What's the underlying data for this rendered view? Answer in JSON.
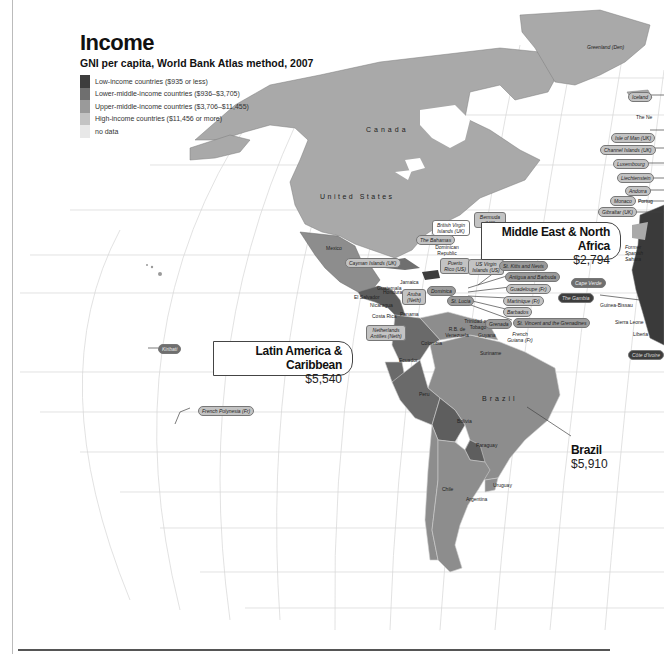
{
  "header": {
    "title": "Income",
    "subtitle": "GNI per capita, World Bank Atlas method, 2007"
  },
  "legend": [
    {
      "label": "Low-income countries ($935 or less)",
      "color": "#3d3d3d"
    },
    {
      "label": "Lower-middle-income countries ($936–$3,705)",
      "color": "#6f6f6f"
    },
    {
      "label": "Upper-middle-income countries ($3,706–$11,455)",
      "color": "#9a9a9a"
    },
    {
      "label": "High-income countries ($11,456 or more)",
      "color": "#c3c3c3"
    },
    {
      "label": "no data",
      "color": "#e8e8e8"
    }
  ],
  "callouts": {
    "mena": {
      "name": "Middle East & North Africa",
      "value": "$2,794"
    },
    "latam": {
      "name": "Latin America & Caribbean",
      "value": "$5,540"
    },
    "brazil": {
      "name": "Brazil",
      "value": "$5,910"
    }
  },
  "country_labels": {
    "canada": "Canada",
    "us": "United States",
    "brazil": "Brazil",
    "mexico": "Mexico",
    "greenland": "Greenland (Den)",
    "colombia": "Colombia",
    "ecuador": "Ecuador",
    "peru": "Peru",
    "bolivia": "Bolivia",
    "paraguay": "Paraguay",
    "chile": "Chile",
    "argentina": "Argentina",
    "uruguay": "Uruguay",
    "venezuela": "R.B. de Venezuela",
    "guyana": "Guyana",
    "suriname": "Suriname",
    "french_guiana": "French Guiana (Fr)",
    "el_salvador": "El Salvador",
    "nicaragua": "Nicaragua",
    "costa_rica": "Costa Rica",
    "panama": "Panama",
    "jamaica": "Jamaica",
    "dominican_rep": "Dominican Republic",
    "trinidad": "Trinidad and Tobago",
    "guatemala": "Guatemala",
    "honduras": "Honduras",
    "belize": "Belize",
    "haiti": "Haiti",
    "former_spanish_sahara": "Former Spanish Sahara",
    "guinea_bissau": "Guinea-Bissau",
    "sierra_leone": "Sierra Leone",
    "liberia": "Liberia",
    "the_ne": "The Ne",
    "portugal": "Portug"
  },
  "pills": {
    "iceland": "Iceland",
    "isle_of_man": "Isle of Man (UK)",
    "channel_islands": "Channel Islands (UK)",
    "luxembourg": "Luxembourg",
    "liechtenstein": "Liechtenstein",
    "andorra": "Andorra",
    "monaco": "Monaco",
    "gibraltar": "Gibraltar (UK)",
    "bermuda": "Bermuda (UK)",
    "bvi": "British Virgin Islands (UK)",
    "bahamas": "The Bahamas",
    "puerto_rico": "Puerto Rico (US)",
    "usvi": "US Virgin Islands (US)",
    "st_kitts": "St. Kitts and Nevis",
    "antigua": "Antigua and Barbuda",
    "guadeloupe": "Guadeloupe (Fr)",
    "martinique": "Martinique (Fr)",
    "barbados": "Barbados",
    "st_vincent": "St. Vincent and the Grenadines",
    "grenada": "Grenada",
    "st_lucia": "St. Lucia",
    "dominica": "Dominica",
    "aruba": "Aruba (Neth)",
    "cayman": "Cayman Islands (UK)",
    "neth_antilles": "Netherlands Antilles (Neth)",
    "cape_verde": "Cape Verde",
    "gambia": "The Gambia",
    "cote": "Côte d'Ivoire",
    "kiribati": "Kiribati",
    "french_polynesia": "French Polynesia (Fr)"
  }
}
